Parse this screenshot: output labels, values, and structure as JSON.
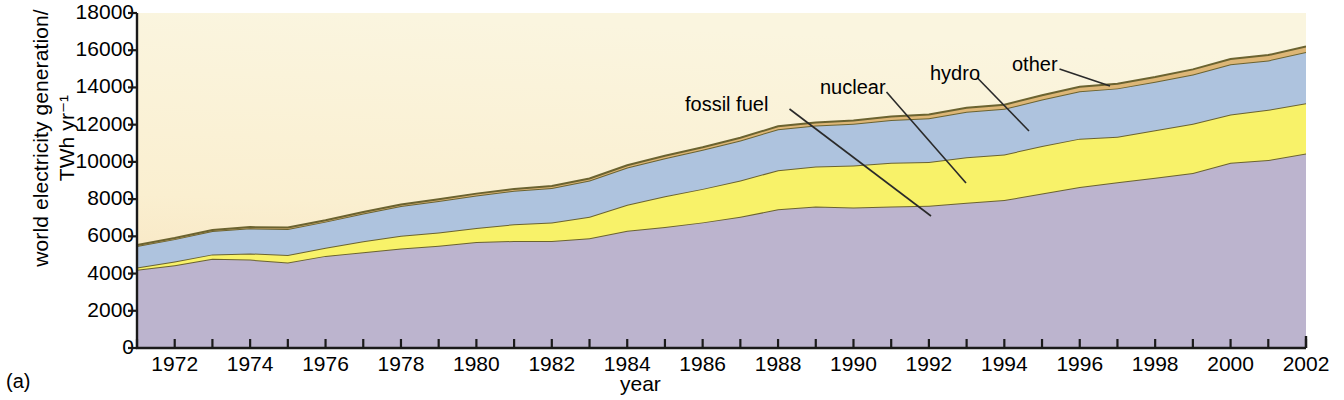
{
  "figure": {
    "panel_label": "(a)",
    "ylabel": "world electricity generation/\nTWh yr⁻¹",
    "xlabel": "year"
  },
  "chart_data": {
    "type": "area",
    "stacked": true,
    "title": "",
    "xlabel": "year",
    "ylabel": "world electricity generation/TWh yr⁻¹",
    "xlim": [
      1971,
      2002
    ],
    "ylim": [
      0,
      18000
    ],
    "ytick_step": 2000,
    "grid": false,
    "legend": "inline-annotations",
    "yticks": [
      0,
      2000,
      4000,
      6000,
      8000,
      10000,
      12000,
      14000,
      16000,
      18000
    ],
    "ytick_labels": [
      "0",
      "2000",
      "4000",
      "6000",
      "8000",
      "10000",
      "12000",
      "14000",
      "16000",
      "18000"
    ],
    "xticks": [
      1971,
      1972,
      1973,
      1974,
      1975,
      1976,
      1977,
      1978,
      1979,
      1980,
      1981,
      1982,
      1983,
      1984,
      1985,
      1986,
      1987,
      1988,
      1989,
      1990,
      1991,
      1992,
      1993,
      1994,
      1995,
      1996,
      1997,
      1998,
      1999,
      2000,
      2001,
      2002
    ],
    "xtick_labels_shown": [
      "1972",
      "1974",
      "1976",
      "1978",
      "1980",
      "1982",
      "1984",
      "1986",
      "1988",
      "1990",
      "1992",
      "1994",
      "1996",
      "1998",
      "2000",
      "2002"
    ],
    "x": [
      1971,
      1972,
      1973,
      1974,
      1975,
      1976,
      1977,
      1978,
      1979,
      1980,
      1981,
      1982,
      1983,
      1984,
      1985,
      1986,
      1987,
      1988,
      1989,
      1990,
      1991,
      1992,
      1993,
      1994,
      1995,
      1996,
      1997,
      1998,
      1999,
      2000,
      2001,
      2002
    ],
    "series": [
      {
        "name": "fossil fuel",
        "color": "#BCB4CE",
        "order": 1,
        "values": [
          4200,
          4450,
          4800,
          4750,
          4600,
          4950,
          5150,
          5350,
          5500,
          5700,
          5750,
          5750,
          5900,
          6300,
          6500,
          6750,
          7050,
          7450,
          7600,
          7550,
          7600,
          7650,
          7800,
          7950,
          8300,
          8650,
          8900,
          9150,
          9400,
          9950,
          10100,
          10450
        ]
      },
      {
        "name": "nuclear",
        "color": "#F8F269",
        "order": 2,
        "values": [
          130,
          200,
          230,
          330,
          400,
          440,
          580,
          680,
          700,
          750,
          900,
          1000,
          1150,
          1400,
          1650,
          1800,
          1950,
          2100,
          2150,
          2250,
          2350,
          2350,
          2450,
          2450,
          2550,
          2600,
          2450,
          2550,
          2650,
          2600,
          2700,
          2700
        ]
      },
      {
        "name": "hydro",
        "color": "#AEC3DE",
        "order": 3,
        "values": [
          1150,
          1200,
          1250,
          1350,
          1400,
          1400,
          1500,
          1600,
          1700,
          1750,
          1800,
          1850,
          1950,
          2000,
          2050,
          2100,
          2150,
          2200,
          2200,
          2250,
          2300,
          2350,
          2450,
          2450,
          2500,
          2550,
          2600,
          2600,
          2650,
          2700,
          2650,
          2750
        ]
      },
      {
        "name": "other",
        "color": "#DDB676",
        "order": 4,
        "values": [
          50,
          55,
          60,
          65,
          70,
          75,
          80,
          85,
          90,
          95,
          100,
          105,
          110,
          120,
          130,
          140,
          150,
          160,
          170,
          180,
          190,
          200,
          210,
          220,
          230,
          240,
          250,
          260,
          270,
          280,
          290,
          300
        ]
      }
    ],
    "totals": [
      5530,
      5905,
      6340,
      6495,
      6470,
      6865,
      7310,
      7715,
      7990,
      8295,
      8550,
      8705,
      9110,
      9820,
      10330,
      10790,
      11300,
      11910,
      12120,
      12230,
      12440,
      12550,
      12910,
      13070,
      13580,
      14040,
      14200,
      14560,
      14970,
      15530,
      15740,
      16200
    ],
    "annotations": [
      {
        "label": "fossil fuel",
        "x": 685,
        "y": 93,
        "leader_to_x": 931,
        "leader_to_y": 216
      },
      {
        "label": "nuclear",
        "x": 820,
        "y": 76,
        "leader_to_x": 966,
        "leader_to_y": 183
      },
      {
        "label": "hydro",
        "x": 930,
        "y": 62,
        "leader_to_x": 1029,
        "leader_to_y": 131
      },
      {
        "label": "other",
        "x": 1012,
        "y": 53,
        "leader_to_x": 1110,
        "leader_to_y": 86
      }
    ]
  },
  "colors": {
    "background_top": "#FAF5DF",
    "background_bottom": "#F7DFB8",
    "axis": "#1a1a1a",
    "fossil_fuel": "#BCB4CE",
    "nuclear": "#F8F269",
    "hydro": "#AEC3DE",
    "other": "#DDB676",
    "band_outline": "#6B6330"
  }
}
